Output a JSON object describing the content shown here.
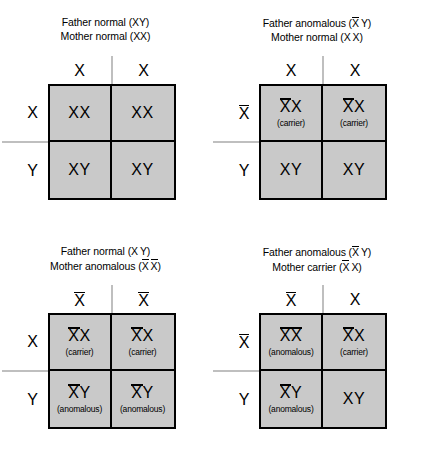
{
  "diagram": {
    "allele_normal": "X",
    "allele_anomalous": "X",
    "allele_y": "Y",
    "shade_color": "#c9c9c9",
    "line_color": "#000000",
    "axis_color": "#808080"
  },
  "quadrants": [
    {
      "id": "father-normal-mother-normal",
      "title_father": "Father normal (XY)",
      "title_mother": "Mother normal (XX)",
      "col_headers": [
        "X",
        "X"
      ],
      "row_headers": [
        "X",
        "Y"
      ],
      "cells": [
        {
          "genotype": "XX",
          "sublabel": "",
          "shaded": true
        },
        {
          "genotype": "XX",
          "sublabel": "",
          "shaded": true
        },
        {
          "genotype": "XY",
          "sublabel": "",
          "shaded": true
        },
        {
          "genotype": "XY",
          "sublabel": "",
          "shaded": true
        }
      ]
    },
    {
      "id": "father-anomalous-mother-normal",
      "title_father": "Father anomalous (X Y)",
      "title_mother": "Mother normal (X X)",
      "col_headers": [
        "X",
        "X"
      ],
      "row_headers": [
        "X",
        "Y"
      ],
      "cells": [
        {
          "genotype": "XX",
          "sublabel": "(carrier)",
          "shaded": true
        },
        {
          "genotype": "XX",
          "sublabel": "(carrier)",
          "shaded": true
        },
        {
          "genotype": "XY",
          "sublabel": "",
          "shaded": true
        },
        {
          "genotype": "XY",
          "sublabel": "",
          "shaded": true
        }
      ]
    },
    {
      "id": "father-normal-mother-anomalous",
      "title_father": "Father normal (X Y)",
      "title_mother": "Mother anomalous (X X)",
      "col_headers": [
        "X",
        "X"
      ],
      "row_headers": [
        "X",
        "Y"
      ],
      "cells": [
        {
          "genotype": "XX",
          "sublabel": "(carrier)",
          "shaded": true
        },
        {
          "genotype": "XX",
          "sublabel": "(carrier)",
          "shaded": true
        },
        {
          "genotype": "XY",
          "sublabel": "(anomalous)",
          "shaded": true
        },
        {
          "genotype": "XY",
          "sublabel": "(anomalous)",
          "shaded": true
        }
      ]
    },
    {
      "id": "father-anomalous-mother-carrier",
      "title_father": "Father anomalous (X Y)",
      "title_mother": "Mother carrier (X X)",
      "col_headers": [
        "X",
        "X"
      ],
      "row_headers": [
        "X",
        "Y"
      ],
      "cells": [
        {
          "genotype": "XX",
          "sublabel": "(anomalous)",
          "shaded": true
        },
        {
          "genotype": "XX",
          "sublabel": "(carrier)",
          "shaded": true
        },
        {
          "genotype": "XY",
          "sublabel": "(anomalous)",
          "shaded": true
        },
        {
          "genotype": "XY",
          "sublabel": "",
          "shaded": true
        }
      ]
    }
  ]
}
